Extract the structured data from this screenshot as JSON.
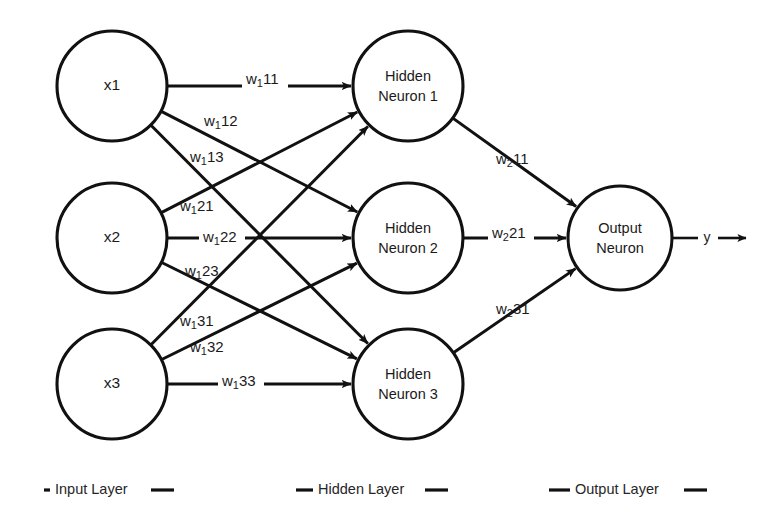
{
  "diagram": {
    "type": "neural-network",
    "background_color": "#ffffff",
    "stroke_color": "#111111",
    "text_color": "#1a1a1a"
  },
  "input_layer": {
    "name": "Input Layer",
    "nodes": [
      {
        "id": "x1",
        "label": "x1",
        "cx": 112,
        "cy": 86,
        "r": 55
      },
      {
        "id": "x2",
        "label": "x2",
        "cx": 112,
        "cy": 238,
        "r": 55
      },
      {
        "id": "x3",
        "label": "x3",
        "cx": 112,
        "cy": 384,
        "r": 55
      }
    ]
  },
  "hidden_layer": {
    "name": "Hidden Layer",
    "nodes": [
      {
        "id": "h1",
        "line1": "Hidden",
        "line2": "Neuron 1",
        "cx": 408,
        "cy": 86,
        "r": 55
      },
      {
        "id": "h2",
        "line1": "Hidden",
        "line2": "Neuron 2",
        "cx": 408,
        "cy": 238,
        "r": 55
      },
      {
        "id": "h3",
        "line1": "Hidden",
        "line2": "Neuron 3",
        "cx": 408,
        "cy": 384,
        "r": 55
      }
    ]
  },
  "output_layer": {
    "name": "Output Layer",
    "nodes": [
      {
        "id": "o1",
        "line1": "Output",
        "line2": "Neuron",
        "cx": 620,
        "cy": 238,
        "r": 52
      }
    ],
    "output_signal": "y"
  },
  "weights_layer1": [
    {
      "id": "w111",
      "base": "w",
      "sub": "1",
      "rest": "11",
      "from": "x1",
      "to": "h1",
      "lx": 246,
      "ly": 80,
      "boxed": true
    },
    {
      "id": "w112",
      "base": "w",
      "sub": "1",
      "rest": "12",
      "from": "x1",
      "to": "h2",
      "lx": 204,
      "ly": 122,
      "boxed": false
    },
    {
      "id": "w113",
      "base": "w",
      "sub": "1",
      "rest": "13",
      "from": "x1",
      "to": "h3",
      "lx": 190,
      "ly": 158,
      "boxed": false
    },
    {
      "id": "w121",
      "base": "w",
      "sub": "1",
      "rest": "21",
      "from": "x2",
      "to": "h1",
      "lx": 180,
      "ly": 207,
      "boxed": false
    },
    {
      "id": "w122",
      "base": "w",
      "sub": "1",
      "rest": "22",
      "from": "x2",
      "to": "h2",
      "lx": 203,
      "ly": 238,
      "boxed": true
    },
    {
      "id": "w123",
      "base": "w",
      "sub": "1",
      "rest": "23",
      "from": "x2",
      "to": "h3",
      "lx": 185,
      "ly": 272,
      "boxed": false
    },
    {
      "id": "w131",
      "base": "w",
      "sub": "1",
      "rest": "31",
      "from": "x3",
      "to": "h1",
      "lx": 180,
      "ly": 322,
      "boxed": false
    },
    {
      "id": "w132",
      "base": "w",
      "sub": "1",
      "rest": "32",
      "from": "x3",
      "to": "h2",
      "lx": 190,
      "ly": 348,
      "boxed": false
    },
    {
      "id": "w133",
      "base": "w",
      "sub": "1",
      "rest": "33",
      "from": "x3",
      "to": "h3",
      "lx": 222,
      "ly": 382,
      "boxed": true
    }
  ],
  "weights_layer2": [
    {
      "id": "w211",
      "base": "w",
      "sub": "2",
      "rest": "11",
      "from": "h1",
      "to": "o1",
      "lx": 496,
      "ly": 160,
      "boxed": false
    },
    {
      "id": "w221",
      "base": "w",
      "sub": "2",
      "rest": "21",
      "from": "h2",
      "to": "o1",
      "lx": 492,
      "ly": 234,
      "boxed": true
    },
    {
      "id": "w231",
      "base": "w",
      "sub": "2",
      "rest": "31",
      "from": "h3",
      "to": "o1",
      "lx": 496,
      "ly": 310,
      "boxed": false
    }
  ],
  "legend": {
    "y": 490,
    "items": [
      {
        "label": "Input Layer",
        "x": 55,
        "dash_left": 44,
        "dash_right": 151
      },
      {
        "label": "Hidden Layer",
        "x": 318,
        "dash_left": 296,
        "dash_right": 425
      },
      {
        "label": "Output Layer",
        "x": 575,
        "dash_left": 549,
        "dash_right": 684
      }
    ]
  }
}
